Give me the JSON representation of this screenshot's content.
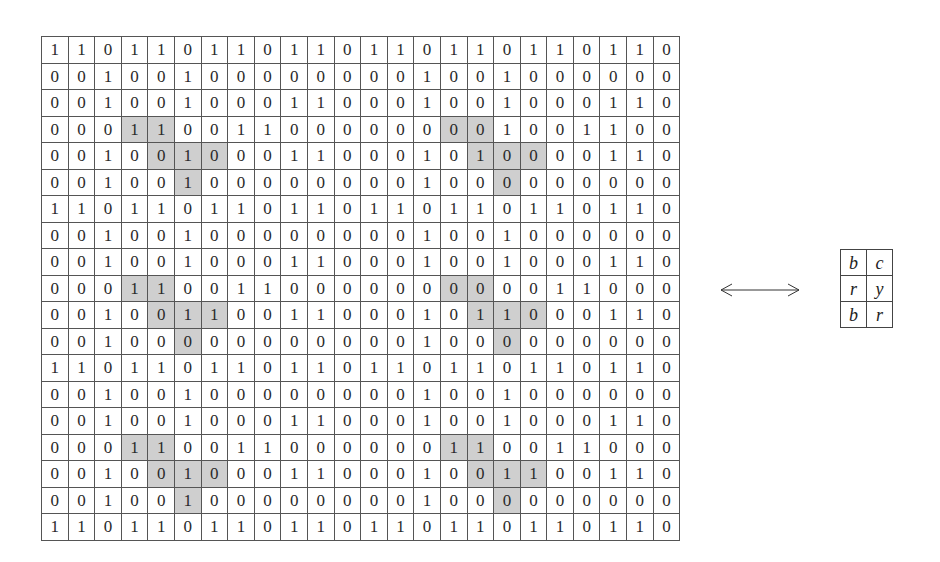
{
  "grid": {
    "rows": [
      "110110110110110110110110",
      "001001000000001001000000",
      "001001000110001001000110",
      "000110011000000001001100",
      "001001000110001010000110",
      "001001000000001000000000",
      "110110110110110110110110",
      "001001000000001001000000",
      "001001000110001001000110",
      "000110011000000000011000",
      "001001100110001011000110",
      "001000000000001000000000",
      "110110110110110110110110",
      "001001000000001001000000",
      "001001000110001001000110",
      "000110011000000110011000",
      "001001000110001001100110",
      "001001000000001000000000",
      "110110110110110110110110"
    ],
    "shaded": [
      [
        3,
        3
      ],
      [
        3,
        4
      ],
      [
        4,
        4
      ],
      [
        4,
        5
      ],
      [
        4,
        6
      ],
      [
        5,
        5
      ],
      [
        3,
        15
      ],
      [
        3,
        16
      ],
      [
        4,
        16
      ],
      [
        4,
        17
      ],
      [
        4,
        18
      ],
      [
        5,
        17
      ],
      [
        9,
        3
      ],
      [
        9,
        4
      ],
      [
        10,
        4
      ],
      [
        10,
        5
      ],
      [
        10,
        6
      ],
      [
        11,
        5
      ],
      [
        9,
        15
      ],
      [
        9,
        16
      ],
      [
        10,
        16
      ],
      [
        10,
        17
      ],
      [
        10,
        18
      ],
      [
        11,
        17
      ],
      [
        15,
        3
      ],
      [
        15,
        4
      ],
      [
        16,
        4
      ],
      [
        16,
        5
      ],
      [
        16,
        6
      ],
      [
        17,
        5
      ],
      [
        15,
        15
      ],
      [
        15,
        16
      ],
      [
        16,
        16
      ],
      [
        16,
        17
      ],
      [
        16,
        18
      ],
      [
        17,
        17
      ]
    ]
  },
  "arrow": {
    "icon": "double-arrow-icon"
  },
  "key": {
    "rows": [
      [
        "b",
        "c"
      ],
      [
        "r",
        "y"
      ],
      [
        "b",
        "r"
      ]
    ]
  }
}
